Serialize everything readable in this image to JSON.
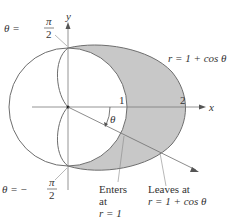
{
  "diagram": {
    "axes": {
      "x_label": "x",
      "y_label": "y"
    },
    "ticks": {
      "one": "1",
      "two": "2"
    },
    "curve_label": "r = 1 + cos θ",
    "angle_label": "θ",
    "top_angle": {
      "prefix": "θ =",
      "num": "π",
      "den": "2"
    },
    "bottom_angle": {
      "prefix": "θ = −",
      "num": "π",
      "den": "2"
    },
    "enters": {
      "line1": "Enters",
      "line2": "at",
      "line3": "r = 1"
    },
    "leaves": {
      "line1": "Leaves at",
      "line2": "r = 1 + cos θ"
    },
    "colors": {
      "shade": "#c8c8c8",
      "stroke": "#6e6e6e",
      "axis": "#7a7a7a"
    }
  }
}
